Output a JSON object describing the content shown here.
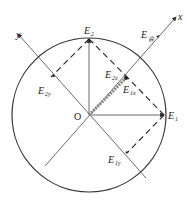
{
  "diagram": {
    "origin_label": "O",
    "axes": {
      "x_label": "x",
      "y_label": "y"
    },
    "vectors": [
      {
        "id": "E1",
        "label": "E",
        "sub": "1"
      },
      {
        "id": "E2",
        "label": "E",
        "sub": "2"
      },
      {
        "id": "Ehe",
        "label": "E",
        "sub": "合"
      },
      {
        "id": "E2x",
        "label": "E",
        "sub": "2x"
      },
      {
        "id": "E1x",
        "label": "E",
        "sub": "1x"
      },
      {
        "id": "E2y",
        "label": "E",
        "sub": "2y"
      },
      {
        "id": "E1y",
        "label": "E",
        "sub": "1y"
      }
    ],
    "colors": {
      "stroke": "#333333",
      "background": "#ffffff"
    }
  }
}
